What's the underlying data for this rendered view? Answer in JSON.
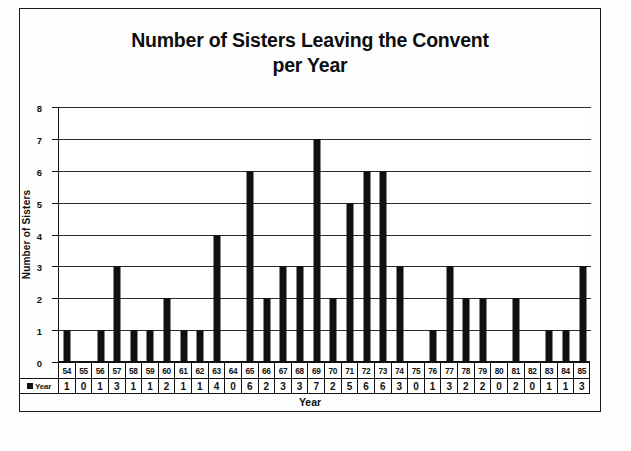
{
  "chart_data": {
    "type": "bar",
    "title": "Number of Sisters Leaving the Convent per Year",
    "title_line1": "Number of Sisters Leaving the Convent",
    "title_line2": "per Year",
    "xlabel": "Year",
    "ylabel": "Number of Sisters",
    "ylim": [
      0,
      8
    ],
    "yticks": [
      0,
      1,
      2,
      3,
      4,
      5,
      6,
      7,
      8
    ],
    "grid": true,
    "legend": [
      "Year"
    ],
    "legend_position": "table-row-header",
    "bar_color": "#111111",
    "categories": [
      "54",
      "55",
      "56",
      "57",
      "58",
      "59",
      "60",
      "61",
      "62",
      "63",
      "64",
      "65",
      "66",
      "67",
      "68",
      "69",
      "70",
      "71",
      "72",
      "73",
      "74",
      "75",
      "76",
      "77",
      "78",
      "79",
      "80",
      "81",
      "82",
      "83",
      "84",
      "85"
    ],
    "values": [
      1,
      0,
      1,
      3,
      1,
      1,
      2,
      1,
      1,
      4,
      0,
      6,
      2,
      3,
      3,
      7,
      2,
      5,
      6,
      6,
      3,
      0,
      1,
      3,
      2,
      2,
      0,
      2,
      0,
      1,
      1,
      3
    ],
    "series": [
      {
        "name": "Year",
        "values": [
          1,
          0,
          1,
          3,
          1,
          1,
          2,
          1,
          1,
          4,
          0,
          6,
          2,
          3,
          3,
          7,
          2,
          5,
          6,
          6,
          3,
          0,
          1,
          3,
          2,
          2,
          0,
          2,
          0,
          1,
          1,
          3
        ]
      }
    ],
    "data_table": {
      "row_label": "Year",
      "columns": [
        "54",
        "55",
        "56",
        "57",
        "58",
        "59",
        "60",
        "61",
        "62",
        "63",
        "64",
        "65",
        "66",
        "67",
        "68",
        "69",
        "70",
        "71",
        "72",
        "73",
        "74",
        "75",
        "76",
        "77",
        "78",
        "79",
        "80",
        "81",
        "82",
        "83",
        "84",
        "85"
      ],
      "row_values": [
        "1",
        "0",
        "1",
        "3",
        "1",
        "1",
        "2",
        "1",
        "1",
        "4",
        "0",
        "6",
        "2",
        "3",
        "3",
        "7",
        "2",
        "5",
        "6",
        "6",
        "3",
        "0",
        "1",
        "3",
        "2",
        "2",
        "0",
        "2",
        "0",
        "1",
        "1",
        "3"
      ]
    }
  }
}
